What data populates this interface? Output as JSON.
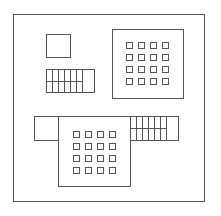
{
  "diagram": {
    "type": "block-layout",
    "stroke_color": "#555555",
    "background": "#ffffff",
    "outer_frame": {
      "x": 13.5,
      "y": 14.5,
      "w": 191,
      "h": 187
    },
    "top_left_block": {
      "x": 46.5,
      "y": 34.5,
      "w": 24,
      "h": 23
    },
    "top_left_grid": {
      "x": 46.5,
      "y": 69.5,
      "w": 48,
      "h": 23,
      "columns_x": [
        52.5,
        58.5,
        64.5,
        70.5,
        76.5,
        82.5
      ],
      "divider_y": 81.5,
      "divider_x_end": 82.5
    },
    "top_right_block": {
      "x": 112.5,
      "y": 29.5,
      "w": 71,
      "h": 69,
      "pad_grid": {
        "origin_x": 126.5,
        "origin_y": 42.5,
        "pitch": 12,
        "size": 6,
        "rows": 4,
        "cols": 4
      }
    },
    "bottom_left_block": {
      "x": 34.5,
      "y": 116.5,
      "w": 24,
      "h": 24
    },
    "bottom_center_block": {
      "x": 58.5,
      "y": 116.5,
      "w": 72,
      "h": 70,
      "pad_grid": {
        "origin_x": 73.5,
        "origin_y": 131.5,
        "pitch": 12,
        "size": 6,
        "rows": 4,
        "cols": 4
      }
    },
    "bottom_right_grid": {
      "x": 130.5,
      "y": 116.5,
      "w": 48,
      "h": 24,
      "columns_x": [
        136.5,
        142.5,
        148.5,
        154.5,
        160.5,
        166.5
      ],
      "divider_y": 128.5,
      "divider_x_end": 166.5
    }
  }
}
